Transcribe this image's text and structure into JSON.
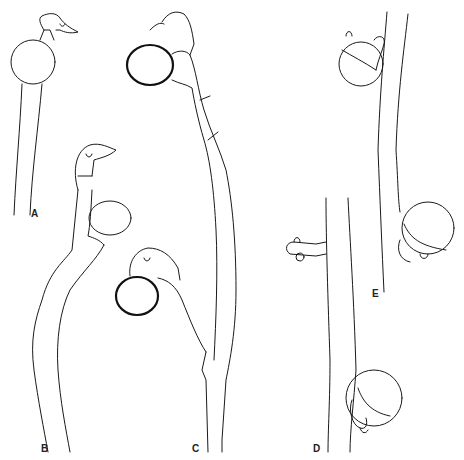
{
  "figure": {
    "type": "line-drawing",
    "panels": [
      {
        "label": "A",
        "x": 35,
        "y": 215
      },
      {
        "label": "B",
        "x": 43,
        "y": 448
      },
      {
        "label": "C",
        "x": 193,
        "y": 448
      },
      {
        "label": "D",
        "x": 314,
        "y": 448
      },
      {
        "label": "E",
        "x": 373,
        "y": 293
      }
    ]
  }
}
